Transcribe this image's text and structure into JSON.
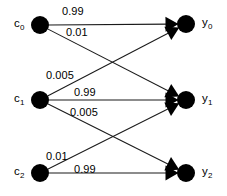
{
  "diagram": {
    "type": "bipartite-channel-diagram",
    "title": "",
    "background_color": "#ffffff",
    "node_color": "#000000",
    "edge_color": "#1a1a1a",
    "source_nodes": [
      {
        "id": "c0",
        "label": "c",
        "subscript": "0",
        "cx": 40,
        "cy": 25,
        "r": 9
      },
      {
        "id": "c1",
        "label": "c",
        "subscript": "1",
        "cx": 40,
        "cy": 100,
        "r": 9
      },
      {
        "id": "c2",
        "label": "c",
        "subscript": "2",
        "cx": 40,
        "cy": 173,
        "r": 9
      }
    ],
    "target_nodes": [
      {
        "id": "y0",
        "label": "y",
        "subscript": "0",
        "cx": 186,
        "cy": 24,
        "r": 9
      },
      {
        "id": "y1",
        "label": "y",
        "subscript": "1",
        "cx": 186,
        "cy": 100,
        "r": 9
      },
      {
        "id": "y2",
        "label": "y",
        "subscript": "2",
        "cx": 186,
        "cy": 173,
        "r": 9
      }
    ],
    "edges": [
      {
        "id": "e-c0-y0",
        "from": "c0",
        "to": "y0",
        "weight": "0.99",
        "label_x": 62,
        "label_y": 6
      },
      {
        "id": "e-c0-y1",
        "from": "c0",
        "to": "y1",
        "weight": "0.01",
        "label_x": 66,
        "label_y": 27
      },
      {
        "id": "e-c1-y0",
        "from": "c1",
        "to": "y0",
        "weight": "0.005",
        "label_x": 46,
        "label_y": 70
      },
      {
        "id": "e-c1-y1",
        "from": "c1",
        "to": "y1",
        "weight": "0.99",
        "label_x": 74,
        "label_y": 87
      },
      {
        "id": "e-c1-y2",
        "from": "c1",
        "to": "y2",
        "weight": "0.005",
        "label_x": 70,
        "label_y": 107
      },
      {
        "id": "e-c2-y1",
        "from": "c2",
        "to": "y1",
        "weight": "0.01",
        "label_x": 46,
        "label_y": 151
      },
      {
        "id": "e-c2-y2",
        "from": "c2",
        "to": "y2",
        "weight": "0.99",
        "label_x": 74,
        "label_y": 164
      }
    ]
  }
}
